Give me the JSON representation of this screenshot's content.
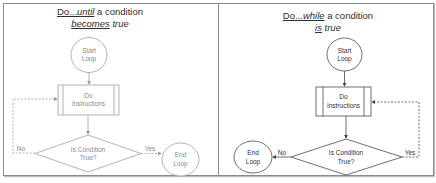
{
  "left_panel": {
    "title_line1_prefix": "Do...",
    "title_line1_keyword": "until",
    "title_line1_suffix": " a condition",
    "title_line2_keyword": "becomes",
    "title_line2_suffix": " true",
    "start": [
      "Start",
      "Loop"
    ],
    "process": [
      "Do",
      "Instructions"
    ],
    "decision": [
      "Is Condition",
      "True?"
    ],
    "end": [
      "End",
      "Loop"
    ],
    "yes_label": "Yes",
    "no_label": "No",
    "stroke_color": "#9a9a9a"
  },
  "right_panel": {
    "title_line1_prefix": "Do...",
    "title_line1_keyword": "while",
    "title_line1_suffix": " a condition",
    "title_line2_keyword": "is",
    "title_line2_suffix": " true",
    "start": [
      "Start",
      "Loop"
    ],
    "process": [
      "Do",
      "Instructions"
    ],
    "decision": [
      "Is Condition",
      "True?"
    ],
    "end": [
      "End",
      "Loop"
    ],
    "yes_label": "Yes",
    "no_label": "No",
    "stroke_color": "#555555"
  }
}
